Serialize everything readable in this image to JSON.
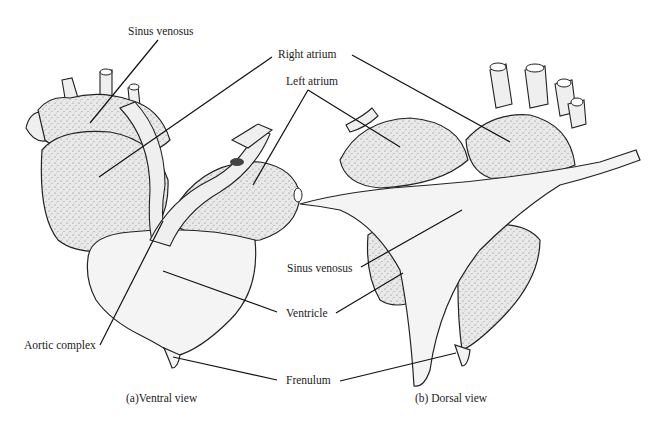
{
  "figure": {
    "panels": [
      {
        "id": "a",
        "caption": "(a)Ventral view"
      },
      {
        "id": "b",
        "caption": "(b) Dorsal view"
      }
    ],
    "labels": {
      "sinus_venosus_top": "Sinus venosus",
      "right_atrium": "Right atrium",
      "left_atrium": "Left atrium",
      "sinus_venosus_mid": "Sinus venosus",
      "ventricle": "Ventricle",
      "aortic_complex": "Aortic complex",
      "frenulum": "Frenulum"
    },
    "colors": {
      "background": "#ffffff",
      "ink": "#222222",
      "fill": "#f4f4f4"
    }
  }
}
